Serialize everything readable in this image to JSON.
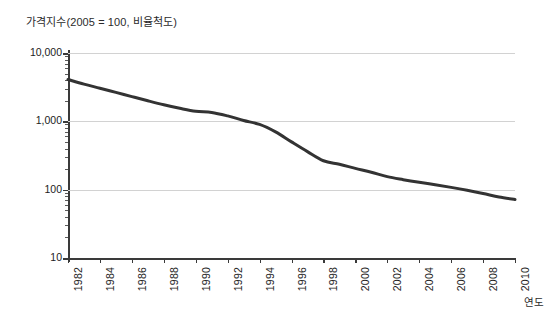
{
  "chart_data": {
    "type": "line",
    "title": "가격지수(2005 = 100, 비율척도)",
    "xlabel": "연도",
    "ylabel": "",
    "yscale": "log",
    "ylim": [
      10,
      10000
    ],
    "xlim": [
      1982,
      2010
    ],
    "grid": true,
    "legend": false,
    "y_ticks": [
      "10,000",
      "1,000",
      "100",
      "10"
    ],
    "y_tick_values": [
      10000,
      1000,
      100,
      10
    ],
    "x_ticks": [
      "1982",
      "1984",
      "1986",
      "1988",
      "1990",
      "1992",
      "1994",
      "1996",
      "1998",
      "2000",
      "2002",
      "2004",
      "2006",
      "2008",
      "2010"
    ],
    "x_tick_values": [
      1982,
      1984,
      1986,
      1988,
      1990,
      1992,
      1994,
      1996,
      1998,
      2000,
      2002,
      2004,
      2006,
      2008,
      2010
    ],
    "series": [
      {
        "name": "가격지수",
        "color": "#333333",
        "x": [
          1982,
          1983,
          1984,
          1985,
          1986,
          1987,
          1988,
          1989,
          1990,
          1991,
          1992,
          1993,
          1994,
          1995,
          1996,
          1997,
          1998,
          1999,
          2000,
          2001,
          2002,
          2003,
          2004,
          2005,
          2006,
          2007,
          2008,
          2009,
          2010
        ],
        "values": [
          4100,
          3500,
          3050,
          2650,
          2300,
          2000,
          1750,
          1550,
          1400,
          1350,
          1200,
          1030,
          900,
          700,
          500,
          360,
          265,
          235,
          205,
          180,
          155,
          140,
          128,
          118,
          108,
          98,
          88,
          78,
          72
        ]
      }
    ]
  }
}
